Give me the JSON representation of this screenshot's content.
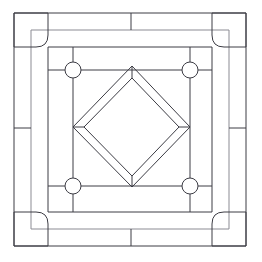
{
  "document": {
    "title": "Decorative Square Tile Pattern",
    "description": "Black-and-white technical line drawing of a square panel with corner blocks, border bands, four circular nodes and a nested double diamond at centre.",
    "medium": "line drawing",
    "background_color": "#ffffff",
    "line_color": "#3c3c44",
    "soft_line_color": "#8b8b93",
    "canvas": {
      "width": 262,
      "height": 262
    }
  },
  "chart_data": {
    "type": "diagram",
    "grid": false,
    "legend": false,
    "xlim": [
      0,
      262
    ],
    "ylim": [
      0,
      262
    ],
    "geometry": {
      "outer_frame": {
        "x": 14,
        "y": 13,
        "width": 232,
        "height": 233
      },
      "band_frame": {
        "x": 31,
        "y": 30,
        "width": 198,
        "height": 199
      },
      "inner_frame": {
        "x": 48,
        "y": 47,
        "width": 164,
        "height": 165
      },
      "node_square": {
        "x": 73,
        "y": 70,
        "width": 117,
        "height": 116
      },
      "corner_blocks": [
        {
          "position": "top-left",
          "x": 14,
          "y": 13,
          "width": 34,
          "height": 34,
          "inner_radius": 12
        },
        {
          "position": "top-right",
          "x": 212,
          "y": 13,
          "width": 34,
          "height": 34,
          "inner_radius": 12
        },
        {
          "position": "bottom-left",
          "x": 14,
          "y": 212,
          "width": 34,
          "height": 34,
          "inner_radius": 12
        },
        {
          "position": "bottom-right",
          "x": 212,
          "y": 212,
          "width": 34,
          "height": 34,
          "inner_radius": 12
        }
      ],
      "circles": [
        {
          "id": "node-top-left",
          "cx": 73,
          "cy": 70,
          "r": 8
        },
        {
          "id": "node-top-right",
          "cx": 190,
          "cy": 70,
          "r": 8
        },
        {
          "id": "node-bottom-left",
          "cx": 73,
          "cy": 186,
          "r": 8
        },
        {
          "id": "node-bottom-right",
          "cx": 190,
          "cy": 186,
          "r": 8
        }
      ],
      "outer_diamond": {
        "top": [
          132,
          66
        ],
        "right": [
          190,
          127
        ],
        "bottom": [
          132,
          187
        ],
        "left": [
          73,
          127
        ]
      },
      "inner_diamond": {
        "top": [
          132,
          78
        ],
        "right": [
          179,
          127
        ],
        "bottom": [
          132,
          176
        ],
        "left": [
          84,
          127
        ]
      },
      "band_dividers": [
        {
          "id": "divider-top-center",
          "orientation": "vertical",
          "x": 131,
          "y1": 13,
          "y2": 30
        },
        {
          "id": "divider-bottom-center",
          "orientation": "vertical",
          "x": 131,
          "y1": 229,
          "y2": 246
        },
        {
          "id": "divider-left-middle",
          "orientation": "horizontal",
          "y": 128,
          "x1": 14,
          "x2": 31
        },
        {
          "id": "divider-right-middle",
          "orientation": "horizontal",
          "y": 128,
          "x1": 229,
          "x2": 246
        }
      ],
      "spokes": [
        {
          "id": "spoke-top-left-up",
          "x1": 73,
          "y1": 47,
          "x2": 73,
          "y2": 62
        },
        {
          "id": "spoke-top-left-left",
          "x1": 48,
          "y1": 70,
          "x2": 65,
          "y2": 70
        },
        {
          "id": "spoke-top-right-up",
          "x1": 190,
          "y1": 47,
          "x2": 190,
          "y2": 62
        },
        {
          "id": "spoke-top-right-right",
          "x1": 198,
          "y1": 70,
          "x2": 212,
          "y2": 70
        },
        {
          "id": "spoke-bottom-left-down",
          "x1": 73,
          "y1": 194,
          "x2": 73,
          "y2": 212
        },
        {
          "id": "spoke-bottom-left-left",
          "x1": 48,
          "y1": 186,
          "x2": 65,
          "y2": 186
        },
        {
          "id": "spoke-bottom-right-down",
          "x1": 190,
          "y1": 194,
          "x2": 190,
          "y2": 212
        },
        {
          "id": "spoke-bottom-right-right",
          "x1": 198,
          "y1": 186,
          "x2": 212,
          "y2": 186
        }
      ]
    },
    "counts": {
      "circles": 4,
      "corner_blocks": 4,
      "diamonds": 2,
      "concentric_frames": 3
    }
  }
}
